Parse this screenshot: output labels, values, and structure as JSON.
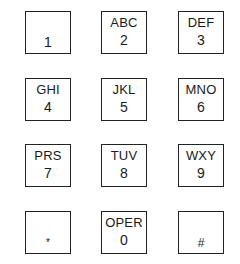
{
  "keypad": {
    "keys": [
      {
        "letters": "",
        "digit": "1"
      },
      {
        "letters": "ABC",
        "digit": "2"
      },
      {
        "letters": "DEF",
        "digit": "3"
      },
      {
        "letters": "GHI",
        "digit": "4"
      },
      {
        "letters": "JKL",
        "digit": "5"
      },
      {
        "letters": "MNO",
        "digit": "6"
      },
      {
        "letters": "PRS",
        "digit": "7"
      },
      {
        "letters": "TUV",
        "digit": "8"
      },
      {
        "letters": "WXY",
        "digit": "9"
      },
      {
        "letters": "",
        "digit": "*"
      },
      {
        "letters": "OPER",
        "digit": "0"
      },
      {
        "letters": "",
        "digit": "#"
      }
    ]
  }
}
